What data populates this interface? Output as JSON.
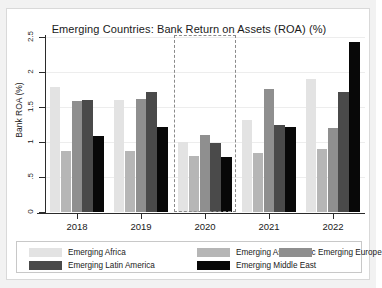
{
  "chart_data": {
    "type": "bar",
    "title": "Emerging Countries: Bank Return on Assets (ROA) (%)",
    "xlabel": "",
    "ylabel": "Bank ROA (%)",
    "categories": [
      "2018",
      "2019",
      "2020",
      "2021",
      "2022"
    ],
    "ylim": [
      0,
      2.5
    ],
    "yticks": [
      "0",
      ".5",
      "1",
      "1.5",
      "2",
      "2.5"
    ],
    "ytick_values": [
      0,
      0.5,
      1,
      1.5,
      2,
      2.5
    ],
    "grid": true,
    "legend_position": "bottom",
    "series": [
      {
        "name": "Emerging Africa",
        "color": "#e3e3e3",
        "values": [
          1.78,
          1.6,
          1.0,
          1.32,
          1.9
        ]
      },
      {
        "name": "Emerging Asia-Pacific",
        "color": "#b6b6b6",
        "values": [
          0.87,
          0.87,
          0.8,
          0.85,
          0.9
        ]
      },
      {
        "name": "Emerging Europe",
        "color": "#8f8f8f",
        "values": [
          1.58,
          1.62,
          1.1,
          1.76,
          1.2
        ]
      },
      {
        "name": "Emerging Latin America",
        "color": "#4a4a4a",
        "values": [
          1.6,
          1.72,
          0.98,
          1.25,
          1.72
        ]
      },
      {
        "name": "Emerging Middle East",
        "color": "#080808",
        "values": [
          1.08,
          1.22,
          0.78,
          1.22,
          2.43
        ]
      }
    ],
    "annotations": [
      {
        "type": "dashed-rectangle",
        "label": "2020 highlight",
        "category": "2020",
        "color": "#8a8a8a"
      }
    ]
  },
  "legend": {
    "rows": [
      [
        {
          "label": "Emerging Africa",
          "color": "#e3e3e3"
        },
        {
          "label": "Emerging Asia-Pacific",
          "color": "#b6b6b6"
        },
        {
          "label": "Emerging Europe",
          "color": "#8f8f8f"
        }
      ],
      [
        {
          "label": "Emerging Latin America",
          "color": "#4a4a4a"
        },
        {
          "label": "Emerging Middle East",
          "color": "#080808"
        }
      ]
    ]
  }
}
